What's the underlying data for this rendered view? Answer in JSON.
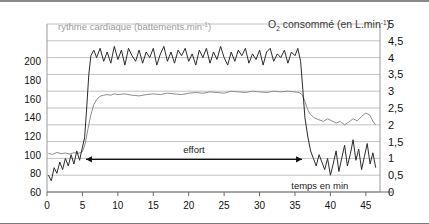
{
  "figure": {
    "left_axis_title": "rythme cardiaque (battements.min",
    "left_axis_title_sup": "-1",
    "left_axis_title_end": ")",
    "right_axis_title_pre": "O",
    "right_axis_title_sub": "2",
    "right_axis_title_mid": " consommé (en L.min",
    "right_axis_title_sup": "-1",
    "right_axis_title_end": ")",
    "effort_label": "effort",
    "time_label": "temps en min"
  },
  "chart_data": {
    "type": "line",
    "title": "",
    "xlabel": "temps en min",
    "ylabel": "rythme cardiaque (battements.min-1)",
    "y2label": "O2 consommé (en L.min-1)",
    "xlim": [
      0,
      47
    ],
    "xticks": [
      0,
      5,
      10,
      15,
      20,
      25,
      30,
      35,
      40,
      45
    ],
    "ylim": [
      60,
      240
    ],
    "yticks": [
      60,
      80,
      100,
      120,
      140,
      160,
      180,
      200
    ],
    "y2lim": [
      0,
      5
    ],
    "y2ticks": [
      "0",
      "0,5",
      "1",
      "1,5",
      "2",
      "2,5",
      "3",
      "3,5",
      "4",
      "4,5",
      "5"
    ],
    "grid": true,
    "legend": "none",
    "annotations": [
      {
        "text": "effort",
        "x_start": 5.5,
        "x_end": 36.0,
        "y": 95,
        "arrow": "double"
      },
      {
        "text": "temps en min",
        "x": 38.5,
        "y": 68
      }
    ],
    "series": [
      {
        "name": "rythme cardiaque",
        "axis": "left",
        "units": "battements.min-1",
        "color": "#2b2b2b",
        "x": [
          0.2,
          0.6,
          1.0,
          1.4,
          1.8,
          2.2,
          2.6,
          3.0,
          3.4,
          3.8,
          4.2,
          4.6,
          5.0,
          5.3,
          5.6,
          5.9,
          6.2,
          6.6,
          7.0,
          7.5,
          8.0,
          8.5,
          9.0,
          9.5,
          10.0,
          10.5,
          11.0,
          11.5,
          12.0,
          12.5,
          13.0,
          13.5,
          14.0,
          14.5,
          15.0,
          15.5,
          16.0,
          16.5,
          17.0,
          17.5,
          18.0,
          18.5,
          19.0,
          19.5,
          20.0,
          20.5,
          21.0,
          21.5,
          22.0,
          22.5,
          23.0,
          23.5,
          24.0,
          24.5,
          25.0,
          25.5,
          26.0,
          26.5,
          27.0,
          27.5,
          28.0,
          28.5,
          29.0,
          29.5,
          30.0,
          30.5,
          31.0,
          31.5,
          32.0,
          32.5,
          33.0,
          33.5,
          34.0,
          34.5,
          35.0,
          35.4,
          35.8,
          36.1,
          36.4,
          36.8,
          37.2,
          37.6,
          38.0,
          38.4,
          38.8,
          39.2,
          39.6,
          40.0,
          40.4,
          40.8,
          41.2,
          41.6,
          42.0,
          42.4,
          42.8,
          43.2,
          43.6,
          44.0,
          44.4,
          44.8,
          45.2,
          45.6,
          46.0,
          46.4
        ],
        "y": [
          78,
          72,
          86,
          80,
          92,
          84,
          96,
          88,
          100,
          90,
          104,
          94,
          108,
          118,
          150,
          186,
          206,
          212,
          204,
          214,
          200,
          210,
          198,
          216,
          202,
          212,
          196,
          214,
          206,
          200,
          212,
          198,
          210,
          204,
          214,
          196,
          208,
          216,
          200,
          210,
          198,
          212,
          206,
          214,
          200,
          208,
          196,
          212,
          204,
          214,
          198,
          210,
          202,
          216,
          204,
          196,
          210,
          200,
          212,
          206,
          214,
          198,
          208,
          202,
          212,
          196,
          210,
          214,
          200,
          208,
          204,
          212,
          198,
          210,
          206,
          214,
          200,
          170,
          140,
          120,
          104,
          96,
          88,
          100,
          92,
          84,
          96,
          78,
          90,
          104,
          82,
          96,
          110,
          88,
          100,
          116,
          94,
          106,
          84,
          98,
          112,
          90,
          102,
          86
        ]
      },
      {
        "name": "O2 consommé",
        "axis": "right",
        "units": "L.min-1",
        "color": "#8e8e8e",
        "x": [
          0.2,
          0.8,
          1.4,
          2.0,
          2.6,
          3.2,
          3.8,
          4.4,
          5.0,
          5.4,
          5.8,
          6.2,
          6.6,
          7.0,
          7.5,
          8.0,
          8.5,
          9.0,
          9.5,
          10.0,
          11.0,
          12.0,
          13.0,
          14.0,
          15.0,
          16.0,
          17.0,
          18.0,
          19.0,
          20.0,
          21.0,
          22.0,
          23.0,
          24.0,
          25.0,
          26.0,
          27.0,
          28.0,
          29.0,
          30.0,
          31.0,
          32.0,
          33.0,
          34.0,
          35.0,
          35.6,
          36.0,
          36.4,
          36.8,
          37.2,
          37.8,
          38.4,
          39.0,
          39.6,
          40.2,
          40.8,
          41.4,
          42.0,
          42.6,
          43.2,
          43.8,
          44.4,
          45.0,
          45.6,
          46.0,
          46.4
        ],
        "y": [
          1.15,
          1.12,
          1.18,
          1.14,
          1.16,
          1.13,
          1.17,
          1.15,
          1.2,
          1.45,
          1.9,
          2.3,
          2.6,
          2.75,
          2.85,
          2.88,
          2.9,
          2.88,
          2.92,
          2.9,
          2.92,
          2.88,
          2.86,
          2.9,
          2.92,
          2.9,
          2.94,
          2.92,
          2.9,
          2.94,
          2.96,
          2.94,
          2.98,
          2.96,
          2.94,
          3.0,
          2.98,
          2.96,
          3.0,
          2.98,
          2.96,
          3.0,
          2.98,
          3.0,
          2.98,
          2.96,
          2.9,
          2.7,
          2.45,
          2.3,
          2.2,
          2.15,
          2.1,
          2.18,
          2.12,
          2.05,
          2.1,
          2.0,
          2.08,
          2.18,
          2.12,
          2.25,
          2.35,
          2.28,
          2.1,
          2.0
        ]
      }
    ]
  }
}
